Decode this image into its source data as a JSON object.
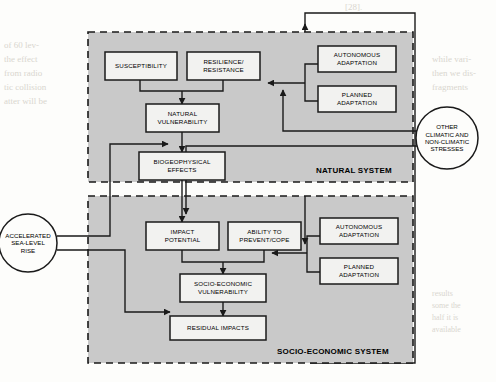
{
  "figure": {
    "type": "flow-diagram",
    "colors": {
      "page_background": "#fdfdfb",
      "system_fill": "#c9c9c9",
      "box_fill": "#f2f2f0",
      "stroke": "#1a1a1a",
      "ghost_text": "#d9d6cf"
    }
  },
  "systems": [
    {
      "id": "natural-system",
      "label": "NATURAL SYSTEM",
      "border_style": "dashed",
      "fill": "#c9c9c9"
    },
    {
      "id": "socio-economic-system",
      "label": "SOCIO-ECONOMIC SYSTEM",
      "border_style": "dashed",
      "fill": "#c9c9c9"
    }
  ],
  "nodes": [
    {
      "id": "susceptibility",
      "label": "SUSCEPTIBILITY",
      "shape": "rect",
      "system": "natural-system"
    },
    {
      "id": "resilience-resistance",
      "label": "RESILIENCE/\nRESISTANCE",
      "shape": "rect",
      "system": "natural-system"
    },
    {
      "id": "natural-vulnerability",
      "label": "NATURAL\nVULNERABILITY",
      "shape": "rect",
      "system": "natural-system"
    },
    {
      "id": "biogeophysical-effects",
      "label": "BIOGEOPHYSICAL\nEFFECTS",
      "shape": "rect",
      "system": "natural-system"
    },
    {
      "id": "autonomous-adaptation-natural",
      "label": "AUTONOMOUS\nADAPTATION",
      "shape": "rect",
      "system": "natural-system"
    },
    {
      "id": "planned-adaptation-natural",
      "label": "PLANNED\nADAPTATION",
      "shape": "rect",
      "system": "natural-system"
    },
    {
      "id": "impact-potential",
      "label": "IMPACT\nPOTENTIAL",
      "shape": "rect",
      "system": "socio-economic-system"
    },
    {
      "id": "ability-to-prevent-cope",
      "label": "ABILITY TO\nPREVENT/COPE",
      "shape": "rect",
      "system": "socio-economic-system"
    },
    {
      "id": "socio-economic-vulnerability",
      "label": "SOCIO-ECONOMIC\nVULNERABILITY",
      "shape": "rect",
      "system": "socio-economic-system"
    },
    {
      "id": "residual-impacts",
      "label": "RESIDUAL IMPACTS",
      "shape": "rect",
      "system": "socio-economic-system"
    },
    {
      "id": "autonomous-adaptation-socio",
      "label": "AUTONOMOUS\nADAPTATION",
      "shape": "rect",
      "system": "socio-economic-system"
    },
    {
      "id": "planned-adaptation-socio",
      "label": "PLANNED\nADAPTATION",
      "shape": "rect",
      "system": "socio-economic-system"
    },
    {
      "id": "accelerated-sea-level-rise",
      "label": "ACCELERATED\nSEA-LEVEL\nRISE",
      "shape": "circle",
      "system": "external"
    },
    {
      "id": "other-stresses",
      "label": "OTHER\nCLIMATIC AND\nNON-CLIMATIC\nSTRESSES",
      "shape": "circle",
      "system": "external"
    }
  ],
  "edges": [
    {
      "from": "susceptibility",
      "to": "natural-vulnerability"
    },
    {
      "from": "resilience-resistance",
      "to": "natural-vulnerability"
    },
    {
      "from": "natural-vulnerability",
      "to": "biogeophysical-effects"
    },
    {
      "from": "accelerated-sea-level-rise",
      "to": "biogeophysical-effects"
    },
    {
      "from": "biogeophysical-effects",
      "to": "impact-potential"
    },
    {
      "from": "autonomous-adaptation-natural",
      "to": "resilience-resistance"
    },
    {
      "from": "planned-adaptation-natural",
      "to": "resilience-resistance"
    },
    {
      "from": "other-stresses",
      "to": "resilience-resistance"
    },
    {
      "from": "other-stresses",
      "to": "impact-potential"
    },
    {
      "from": "impact-potential",
      "to": "socio-economic-vulnerability"
    },
    {
      "from": "ability-to-prevent-cope",
      "to": "socio-economic-vulnerability"
    },
    {
      "from": "autonomous-adaptation-socio",
      "to": "ability-to-prevent-cope"
    },
    {
      "from": "planned-adaptation-socio",
      "to": "ability-to-prevent-cope"
    },
    {
      "from": "socio-economic-vulnerability",
      "to": "residual-impacts"
    },
    {
      "from": "accelerated-sea-level-rise",
      "to": "residual-impacts"
    },
    {
      "from": "residual-impacts",
      "to": "ability-to-prevent-cope",
      "routing": "feedback-right"
    },
    {
      "from": "residual-impacts",
      "to": "autonomous-adaptation-natural",
      "routing": "feedback-top"
    }
  ],
  "background_text": {
    "top_right": "[28].",
    "left_col": "of 60 lev-\nthe effect\nfrom radio\ntic collision\natter will be",
    "right_col_1": "while vari-\nthen we dis-\nfragments",
    "right_col_2": "results\nsome the\nhalf it is\navailable"
  }
}
